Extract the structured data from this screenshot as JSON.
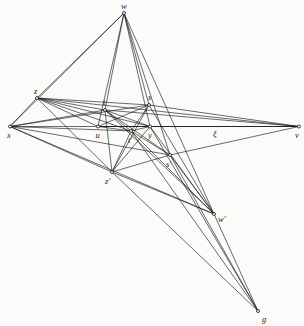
{
  "figure": {
    "background_color": "#fbfbfa",
    "line_color": "#1a1a1a",
    "label_color": "#1b1b1b",
    "width": 304,
    "height": 326
  },
  "points": [
    {
      "id": "w",
      "label": "w",
      "x": 124.0,
      "y": 13.0,
      "label_dx": -3.0,
      "label_dy": -11.0
    },
    {
      "id": "z",
      "label": "z",
      "x": 37.0,
      "y": 98.0,
      "label_dx": -3.0,
      "label_dy": -11.0
    },
    {
      "id": "t",
      "label": "t",
      "x": 105.0,
      "y": 110.0,
      "label_dx": -2.0,
      "label_dy": -12.0
    },
    {
      "id": "s",
      "label": "s",
      "x": 149.0,
      "y": 105.0,
      "label_dx": -1.0,
      "label_dy": -12.0
    },
    {
      "id": "x",
      "label": "x",
      "x": 10.0,
      "y": 126.5,
      "label_dx": -3.0,
      "label_dy": 4.0
    },
    {
      "id": "u",
      "label": "u",
      "x": 98.0,
      "y": 126.5,
      "label_dx": -2.5,
      "label_dy": 4.0
    },
    {
      "id": "y",
      "label": "y",
      "x": 150.0,
      "y": 126.5,
      "label_dx": -2.0,
      "label_dy": 4.0
    },
    {
      "id": "v",
      "label": "v",
      "x": 299.0,
      "y": 126.5,
      "label_dx": -4.0,
      "label_dy": 4.0
    },
    {
      "id": "tp",
      "label": "t′",
      "x": 131.0,
      "y": 131.0,
      "label_dx": -3.0,
      "label_dy": 5.0
    },
    {
      "id": "sp",
      "label": "s′",
      "x": 170.0,
      "y": 155.0,
      "label_dx": -4.0,
      "label_dy": 5.0
    },
    {
      "id": "zp",
      "label": "z′",
      "x": 112.0,
      "y": 172.0,
      "label_dx": -7.0,
      "label_dy": 5.0
    },
    {
      "id": "wp",
      "label": "w′",
      "x": 214.0,
      "y": 214.0,
      "label_dx": 4.0,
      "label_dy": 1.0
    },
    {
      "id": "g",
      "label": "g",
      "x": 258.0,
      "y": 311.0,
      "label_dx": 4.0,
      "label_dy": 4.0
    }
  ],
  "auxiliary_labels": [
    {
      "id": "xi",
      "label": "ξ",
      "x": 213.0,
      "y": 130.0
    }
  ],
  "edges": [
    {
      "from": "w",
      "to": "x"
    },
    {
      "from": "w",
      "to": "z"
    },
    {
      "from": "w",
      "to": "t"
    },
    {
      "from": "w",
      "to": "u"
    },
    {
      "from": "w",
      "to": "s"
    },
    {
      "from": "w",
      "to": "y"
    },
    {
      "from": "w",
      "to": "sp"
    },
    {
      "from": "w",
      "to": "wp"
    },
    {
      "from": "x",
      "to": "v"
    },
    {
      "from": "x",
      "to": "z"
    },
    {
      "from": "x",
      "to": "t"
    },
    {
      "from": "x",
      "to": "s"
    },
    {
      "from": "x",
      "to": "tp"
    },
    {
      "from": "x",
      "to": "sp"
    },
    {
      "from": "x",
      "to": "zp"
    },
    {
      "from": "x",
      "to": "wp"
    },
    {
      "from": "z",
      "to": "v"
    },
    {
      "from": "z",
      "to": "t"
    },
    {
      "from": "z",
      "to": "s"
    },
    {
      "from": "z",
      "to": "u"
    },
    {
      "from": "z",
      "to": "y"
    },
    {
      "from": "z",
      "to": "tp"
    },
    {
      "from": "z",
      "to": "zp"
    },
    {
      "from": "t",
      "to": "v"
    },
    {
      "from": "t",
      "to": "y"
    },
    {
      "from": "t",
      "to": "tp"
    },
    {
      "from": "t",
      "to": "sp"
    },
    {
      "from": "t",
      "to": "zp"
    },
    {
      "from": "t",
      "to": "wp"
    },
    {
      "from": "s",
      "to": "v"
    },
    {
      "from": "s",
      "to": "u"
    },
    {
      "from": "s",
      "to": "tp"
    },
    {
      "from": "s",
      "to": "zp"
    },
    {
      "from": "s",
      "to": "wp"
    },
    {
      "from": "u",
      "to": "v"
    },
    {
      "from": "u",
      "to": "tp"
    },
    {
      "from": "u",
      "to": "y"
    },
    {
      "from": "y",
      "to": "v"
    },
    {
      "from": "y",
      "to": "tp"
    },
    {
      "from": "y",
      "to": "zp"
    },
    {
      "from": "y",
      "to": "wp"
    },
    {
      "from": "y",
      "to": "g"
    },
    {
      "from": "tp",
      "to": "sp"
    },
    {
      "from": "tp",
      "to": "zp"
    },
    {
      "from": "tp",
      "to": "wp"
    },
    {
      "from": "tp",
      "to": "g"
    },
    {
      "from": "sp",
      "to": "zp"
    },
    {
      "from": "sp",
      "to": "wp"
    },
    {
      "from": "sp",
      "to": "g"
    },
    {
      "from": "sp",
      "to": "v"
    },
    {
      "from": "zp",
      "to": "wp"
    },
    {
      "from": "zp",
      "to": "g"
    },
    {
      "from": "wp",
      "to": "g"
    }
  ]
}
